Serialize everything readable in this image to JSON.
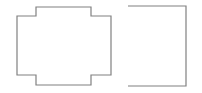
{
  "canvas": {
    "width": 202,
    "height": 93,
    "background_color": "#ffffff",
    "title": "Shape Outlines"
  },
  "style": {
    "stroke_color": "#808080",
    "stroke_width": 1.2,
    "fill": "none"
  },
  "shapes": [
    {
      "id": "cross-shape",
      "name": "cruciform-polygon",
      "type": "polygon",
      "description": "Rectangle with raised tab on top edge and lowered tab on bottom edge",
      "closed": true,
      "points": "17,16 36,16 36,7 91,7 91,16 111,16 111,75 91,75 91,85 36,85 36,75 17,75",
      "bounds": {
        "x": 17,
        "y": 7,
        "width": 94,
        "height": 78
      },
      "vertex_count": 12
    },
    {
      "id": "open-rect-shape",
      "name": "open-rectangle-polyline",
      "type": "polyline",
      "description": "Rectangle outline missing its left vertical edge, open toward the left",
      "closed": false,
      "points": "128,6 186,6 186,86 128,86",
      "bounds": {
        "x": 128,
        "y": 6,
        "width": 58,
        "height": 80
      },
      "vertex_count": 4
    }
  ]
}
